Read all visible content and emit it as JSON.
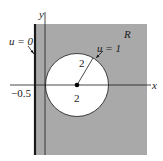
{
  "diagram": {
    "region_label": "R",
    "axis_x_label": "x",
    "axis_y_label": "y",
    "boundary_left_label": "u = 0",
    "boundary_circle_label": "u = 1",
    "radius_label": "2",
    "center_label": "2",
    "left_line_label": "−0.5",
    "colors": {
      "region_fill": "#a9a9a9",
      "circle_fill": "#ffffff",
      "lines": "#1a1a1a"
    }
  }
}
